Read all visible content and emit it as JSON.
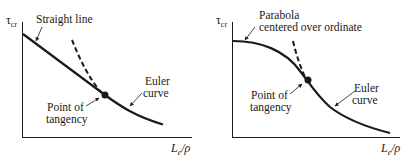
{
  "diagrams": [
    {
      "id": "left",
      "y_axis_label": "τ",
      "y_axis_subscript": "cr",
      "x_axis_label": "Le/ρ",
      "x_axis_main": "L",
      "x_axis_sub": "e",
      "x_axis_tail": "/ρ",
      "labels": {
        "line": "Straight line",
        "tangency_line1": "Point of",
        "tangency_line2": "tangency",
        "euler_line1": "Euler",
        "euler_line2": "curve"
      }
    },
    {
      "id": "right",
      "y_axis_label": "τ",
      "y_axis_subscript": "cr",
      "x_axis_main": "L",
      "x_axis_sub": "e",
      "x_axis_tail": "/ρ",
      "labels": {
        "parabola_line1": "Parabola",
        "parabola_line2": "centered over ordinate",
        "tangency_line1": "Point of",
        "tangency_line2": "tangency",
        "euler_line1": "Euler",
        "euler_line2": "curve"
      }
    }
  ],
  "colors": {
    "ink": "#1a1a1a",
    "background": "#ffffff"
  }
}
